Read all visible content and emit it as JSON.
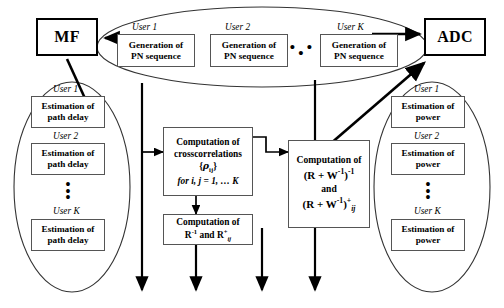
{
  "diagram": {
    "terminals": [
      {
        "name": "mf",
        "label": "MF"
      },
      {
        "name": "adc",
        "label": "ADC"
      }
    ],
    "groups": [
      {
        "name": "pn-generation-group",
        "shape": "ellipse",
        "users": [
          {
            "user_label": "User 1",
            "box_line1": "Generation of",
            "box_line2": "PN sequence"
          },
          {
            "user_label": "User 2",
            "box_line1": "Generation of",
            "box_line2": "PN sequence"
          },
          {
            "user_label": "User K",
            "box_line1": "Generation of",
            "box_line2": "PN sequence"
          }
        ],
        "ellipsis": "• • •"
      },
      {
        "name": "path-delay-group",
        "shape": "ellipse",
        "users": [
          {
            "user_label": "User 1",
            "box_line1": "Estimation of",
            "box_line2": "path delay"
          },
          {
            "user_label": "User 2",
            "box_line1": "Estimation of",
            "box_line2": "path delay"
          },
          {
            "user_label": "User K",
            "box_line1": "Estimation of",
            "box_line2": "path delay"
          }
        ],
        "ellipsis": "vertical-dots"
      },
      {
        "name": "power-estimation-group",
        "shape": "ellipse",
        "users": [
          {
            "user_label": "User 1",
            "box_line1": "Estimation of",
            "box_line2": "power"
          },
          {
            "user_label": "User 2",
            "box_line1": "Estimation of",
            "box_line2": "power"
          },
          {
            "user_label": "User K",
            "box_line1": "Estimation of",
            "box_line2": "power"
          }
        ],
        "ellipsis": "vertical-dots"
      }
    ],
    "computation_blocks": [
      {
        "name": "crosscorrelation-block",
        "line1": "Computation of",
        "line2": "crosscorrelations",
        "line3": "{ρij}",
        "line3_symbol": "ρ",
        "line3_sub": "ij",
        "line4": "for i, j = 1, … K"
      },
      {
        "name": "matrix-inverse-block",
        "line1": "Computation of",
        "line2_base": "R",
        "line2_sup": "-1",
        "line2_mid": "and",
        "line2_base2": "R",
        "line2_sup2": "+",
        "line2_sub2": "ij",
        "line2_plain": "R -1 and R +ij"
      },
      {
        "name": "rw-inverse-block",
        "line1": "Computation of",
        "line2": "(R + W-1) -1",
        "line3": "and",
        "line4": "(R + W-1) +ij",
        "matrix_r": "R",
        "matrix_w": "W",
        "sup_minus1": "-1",
        "sup_plus": "+",
        "sub_ij": "ij",
        "and_text": "and"
      }
    ],
    "output_arrows_count": 4
  }
}
